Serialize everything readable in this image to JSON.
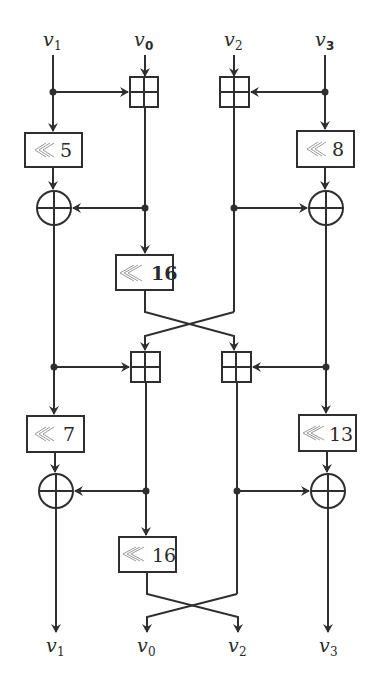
{
  "diagram": {
    "inputs": [
      {
        "name": "v",
        "sub": "1",
        "x": 53
      },
      {
        "name": "v",
        "sub": "0",
        "x": 145
      },
      {
        "name": "v",
        "sub": "2",
        "x": 234
      },
      {
        "name": "v",
        "sub": "3",
        "x": 325
      }
    ],
    "outputs": [
      {
        "name": "v",
        "sub": "1"
      },
      {
        "name": "v",
        "sub": "0"
      },
      {
        "name": "v",
        "sub": "2"
      },
      {
        "name": "v",
        "sub": "3"
      }
    ],
    "rotations": {
      "r1_left": "5",
      "r1_right": "8",
      "r1_center": "16",
      "r2_left": "7",
      "r2_right": "13",
      "r2_center": "16"
    },
    "operators": {
      "add": "modular-addition",
      "xor": "xor",
      "rotate": "rotate-left"
    },
    "colors": {
      "stroke": "#2e2e2e",
      "rot_symbol": "#9a9a9a",
      "background": "#ffffff"
    }
  }
}
